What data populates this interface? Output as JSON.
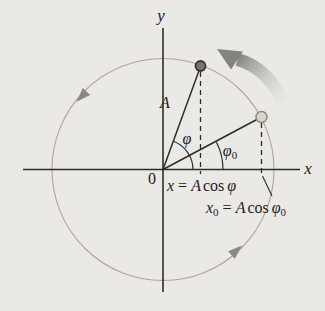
{
  "figure": {
    "axis": {
      "y_label": "y",
      "x_label": "x",
      "origin_label": "0"
    },
    "labels": {
      "amplitude": "A",
      "phase": "φ",
      "initial_phase": "φ",
      "initial_phase_sub": "0"
    },
    "equations": {
      "x_projection": {
        "lhs": "x",
        "rel": " = ",
        "amp": "A",
        "fn": "cos",
        "arg": "φ"
      },
      "x0_projection": {
        "lhs": "x",
        "lhs_sub": "0",
        "rel": " = ",
        "amp": "A",
        "fn": "cos",
        "arg": "φ",
        "arg_sub": "0"
      }
    },
    "geometry": {
      "rotation_direction": "counterclockwise",
      "phase_angle_deg": 70,
      "initial_phase_angle_deg": 27
    },
    "colors": {
      "background": "#eae9e5",
      "axis_line": "#2e2c29",
      "circle_line": "#aca69d",
      "dark_dot_fill": "#7a726a",
      "dark_dot_stroke": "#3b3530",
      "light_dot_fill": "#d8d4cc",
      "light_dot_stroke": "#8b857c",
      "rotation_arrow": "#85837e",
      "rotation_arrow_fade": "#dedcd7",
      "direction_arrow": "#8a8884"
    }
  }
}
